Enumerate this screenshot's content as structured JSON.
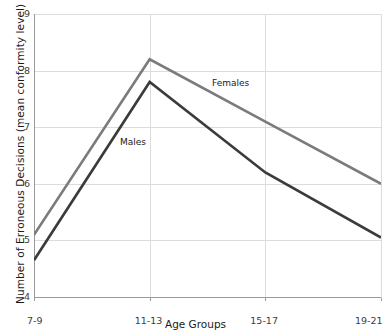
{
  "chart_data": {
    "type": "line",
    "title": "",
    "xlabel": "Age Groups",
    "ylabel": "Number of Erroneous Decisions (mean conformity level)",
    "categories": [
      "7-9",
      "11-13",
      "15-17",
      "19-21"
    ],
    "ylim": [
      4,
      9
    ],
    "yticks": [
      4,
      5,
      6,
      7,
      8,
      9
    ],
    "ytick_labels": [
      "4",
      "5",
      "6",
      "7",
      "8",
      "9"
    ],
    "grid": true,
    "legend_position": "inline-annotations",
    "series": [
      {
        "name": "Females",
        "color": "#7b7b7b",
        "values": [
          5.1,
          8.2,
          7.1,
          6.0
        ]
      },
      {
        "name": "Males",
        "color": "#3b3b3b",
        "values": [
          4.65,
          7.8,
          6.2,
          5.05
        ]
      }
    ],
    "annotations": [
      {
        "text": "Females",
        "x_px": 212,
        "y_px": 78,
        "series": "Females"
      },
      {
        "text": "Males",
        "x_px": 120,
        "y_px": 137,
        "series": "Males"
      }
    ]
  }
}
